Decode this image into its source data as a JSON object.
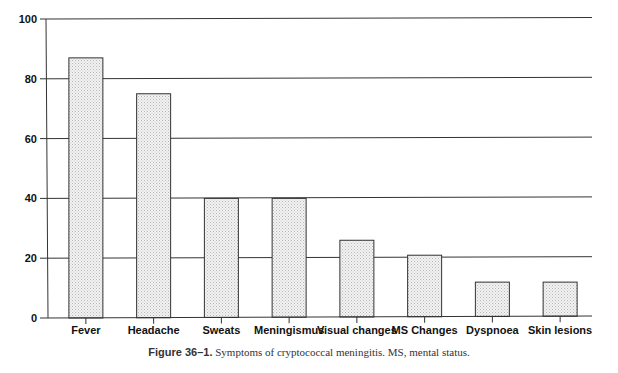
{
  "chart_data": {
    "type": "bar",
    "title": "",
    "xlabel": "",
    "ylabel": "",
    "ylim": [
      0,
      100
    ],
    "yticks": [
      0,
      20,
      40,
      60,
      80,
      100
    ],
    "grid": true,
    "legend": null,
    "categories": [
      "Fever",
      "Headache",
      "Sweats",
      "Meningismus",
      "Visual changes",
      "MS Changes",
      "Dyspnoea",
      "Skin lesions"
    ],
    "values": [
      87,
      75,
      40,
      40,
      26,
      21,
      12,
      12
    ]
  },
  "caption": {
    "figure_label": "Figure 36–1.",
    "text": " Symptoms of cryptococcal meningitis. MS, mental status."
  },
  "colors": {
    "bar_fill": "#e6e6e6",
    "bar_stroke": "#333333",
    "grid": "#333333"
  }
}
